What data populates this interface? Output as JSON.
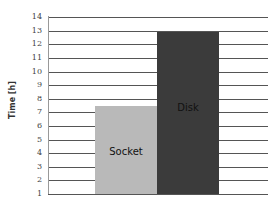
{
  "chart_data": {
    "type": "bar",
    "title": "",
    "xlabel": "",
    "ylabel": "Time [h]",
    "categories": [
      "Socket",
      "Disk"
    ],
    "values": [
      7.5,
      12.9
    ],
    "ylim": [
      1,
      14
    ],
    "yticks": [
      "14",
      "13",
      "12",
      "11",
      "10",
      "9",
      "8",
      "7",
      "6",
      "5",
      "4",
      "3",
      "2",
      "1"
    ],
    "grid": true,
    "legend": "none",
    "colors": {
      "Socket": "#b9b9b9",
      "Disk": "#3b3b3b"
    }
  }
}
